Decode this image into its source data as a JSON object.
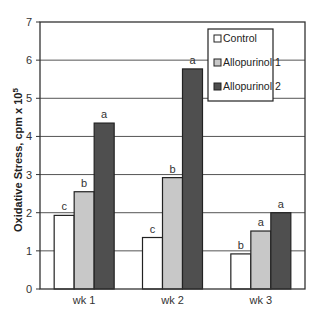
{
  "chart_data": {
    "type": "bar",
    "title": "",
    "xlabel": "",
    "ylabel": "Oxidative Stress, cpm x 10",
    "ylabel_superscript": "5",
    "ylim": [
      0,
      7
    ],
    "yticks": [
      0,
      1,
      2,
      3,
      4,
      5,
      6,
      7
    ],
    "grid": true,
    "legend_position": "upper right (inside)",
    "categories": [
      "wk 1",
      "wk 2",
      "wk 3"
    ],
    "series": [
      {
        "name": "Control",
        "color": "#ffffff",
        "values": [
          1.93,
          1.35,
          0.92
        ],
        "labels": [
          "c",
          "c",
          "b"
        ]
      },
      {
        "name": "Allopurinol 1",
        "color": "#c8c8c8",
        "values": [
          2.55,
          2.92,
          1.52
        ],
        "labels": [
          "b",
          "b",
          "a"
        ]
      },
      {
        "name": "Allopurinol 2",
        "color": "#4f4f4f",
        "values": [
          4.35,
          5.77,
          2.0
        ],
        "labels": [
          "a",
          "a",
          "a"
        ]
      }
    ]
  }
}
